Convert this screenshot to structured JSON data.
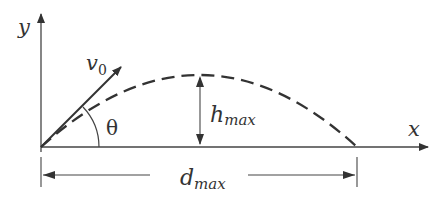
{
  "diagram": {
    "labels": {
      "y_axis": "y",
      "x_axis": "x",
      "velocity": "v",
      "velocity_sub": "0",
      "angle": "θ",
      "height": "h",
      "height_sub": "max",
      "distance": "d",
      "distance_sub": "max"
    },
    "colors": {
      "stroke": "#333333",
      "background": "#ffffff"
    }
  }
}
